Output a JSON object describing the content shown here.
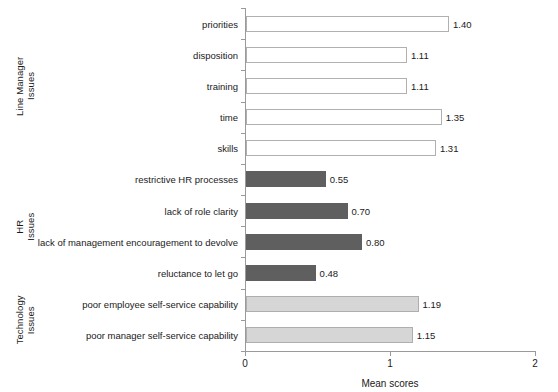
{
  "chart_data": {
    "type": "bar",
    "orientation": "horizontal",
    "title": "",
    "xlabel": "Mean scores",
    "ylabel": "",
    "xlim": [
      0,
      2
    ],
    "xticks": [
      "0",
      "1",
      "2"
    ],
    "grid": false,
    "legend": null,
    "categories": [
      "priorities",
      "disposition",
      "training",
      "time",
      "skills",
      "restrictive HR processes",
      "lack of role clarity",
      "lack of management encouragement to devolve",
      "reluctance to let go",
      "poor employee self-service capability",
      "poor manager self-service capability"
    ],
    "values": [
      1.4,
      1.11,
      1.11,
      1.35,
      1.31,
      0.55,
      0.7,
      0.8,
      0.48,
      1.19,
      1.15
    ],
    "value_labels": [
      "1.40",
      "1.11",
      "1.11",
      "1.35",
      "1.31",
      "0.55",
      "0.70",
      "0.80",
      "0.48",
      "1.19",
      "1.15"
    ],
    "groups": [
      {
        "label": "Line Manager\nIssues",
        "style": "line-manager",
        "count": 5,
        "color": "#ffffff"
      },
      {
        "label": "HR\nIssues",
        "style": "hr",
        "count": 4,
        "color": "#5f5f5f"
      },
      {
        "label": "Technology\nIssues",
        "style": "technology",
        "count": 2,
        "color": "#d6d6d6"
      }
    ],
    "bar_styles": [
      "line-manager",
      "line-manager",
      "line-manager",
      "line-manager",
      "line-manager",
      "hr",
      "hr",
      "hr",
      "hr",
      "technology",
      "technology"
    ]
  }
}
